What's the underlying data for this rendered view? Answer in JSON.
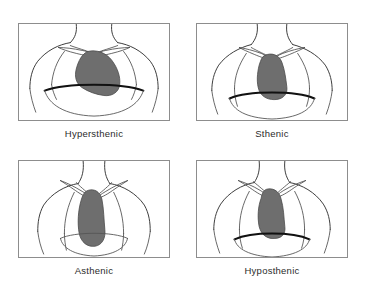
{
  "figure": {
    "organ_color": "#6e6e6e",
    "outline_color": "#3a3a3a",
    "frame_color": "#8d8d8d",
    "background_color": "#ffffff"
  },
  "panels": [
    {
      "id": "hypersthenic",
      "caption": "Hypersthenic",
      "icon": "thorax-hypersthenic-icon",
      "row": 1,
      "column": 1
    },
    {
      "id": "sthenic",
      "caption": "Sthenic",
      "icon": "thorax-sthenic-icon",
      "row": 1,
      "column": 2
    },
    {
      "id": "asthenic",
      "caption": "Asthenic",
      "icon": "thorax-asthenic-icon",
      "row": 2,
      "column": 1
    },
    {
      "id": "hyposthenic",
      "caption": "Hyposthenic",
      "icon": "thorax-hyposthenic-icon",
      "row": 2,
      "column": 2
    }
  ]
}
